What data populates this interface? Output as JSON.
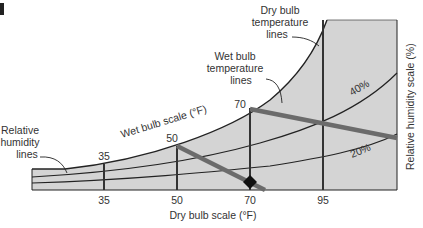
{
  "figure": {
    "corner_mark": ""
  },
  "labels": {
    "dry_bulb_lines": [
      "Dry bulb",
      "temperature",
      "lines"
    ],
    "wet_bulb_lines": [
      "Wet bulb",
      "temperature",
      "lines"
    ],
    "rh_lines": [
      "Relative",
      "humidity",
      "lines"
    ],
    "wet_bulb_scale": "Wet bulb scale (°F)",
    "rh_scale": "Relative humidity scale (%)",
    "x_axis_title": "Dry bulb scale (°F)",
    "rh_40": "40%",
    "rh_20": "20%"
  },
  "x_ticks": [
    "35",
    "50",
    "70",
    "95"
  ],
  "wet_bulb_ticks": [
    "35",
    "50",
    "70"
  ],
  "colors": {
    "fill": "#d4d4d4",
    "line": "#222222",
    "wet_bulb_line": "#6b6b6b",
    "text": "#333333"
  }
}
